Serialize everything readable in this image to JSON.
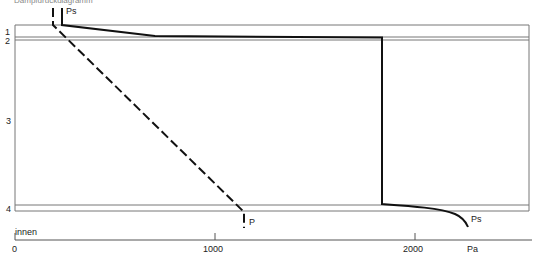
{
  "title": "Dampfdruckdiagramm",
  "layers": [
    {
      "label": "1"
    },
    {
      "label": "2"
    },
    {
      "label": "3"
    },
    {
      "label": "4"
    }
  ],
  "curves": {
    "saturation": {
      "label": "Ps",
      "style": "solid"
    },
    "partial": {
      "label": "P",
      "style": "dashed"
    }
  },
  "axis": {
    "side_label": "innen",
    "unit": "Pa",
    "ticks": [
      {
        "label": "0",
        "value": 0
      },
      {
        "label": "1000",
        "value": 1000
      },
      {
        "label": "2000",
        "value": 2000
      }
    ]
  },
  "colors": {
    "line": "#111111",
    "frame": "#777777"
  }
}
